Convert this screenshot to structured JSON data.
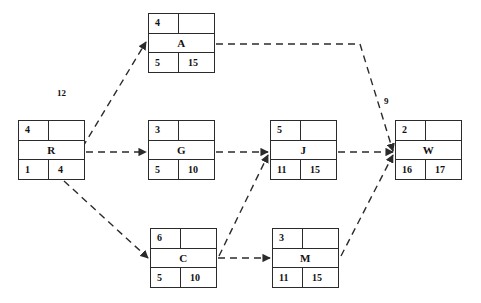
{
  "diagram": {
    "type": "activity-on-node-network",
    "background_color": "#ffffff",
    "line_color": "#2b2b2b",
    "edge_style": "dashed-arrow"
  },
  "nodes": [
    {
      "id": "R",
      "name": "R",
      "top_left": "4",
      "top_right": "",
      "bottom_left": "1",
      "bottom_right": "4",
      "x": 18,
      "y": 120
    },
    {
      "id": "A",
      "name": "A",
      "top_left": "4",
      "top_right": "",
      "bottom_left": "5",
      "bottom_right": "15",
      "x": 148,
      "y": 13
    },
    {
      "id": "G",
      "name": "G",
      "top_left": "3",
      "top_right": "",
      "bottom_left": "5",
      "bottom_right": "10",
      "x": 148,
      "y": 120
    },
    {
      "id": "C",
      "name": "C",
      "top_left": "6",
      "top_right": "",
      "bottom_left": "5",
      "bottom_right": "10",
      "x": 150,
      "y": 228
    },
    {
      "id": "J",
      "name": "J",
      "top_left": "5",
      "top_right": "",
      "bottom_left": "11",
      "bottom_right": "15",
      "x": 270,
      "y": 120
    },
    {
      "id": "M",
      "name": "M",
      "top_left": "3",
      "top_right": "",
      "bottom_left": "11",
      "bottom_right": "15",
      "x": 272,
      "y": 228
    },
    {
      "id": "W",
      "name": "W",
      "top_left": "2",
      "top_right": "",
      "bottom_left": "16",
      "bottom_right": "17",
      "x": 395,
      "y": 120
    }
  ],
  "edges": [
    {
      "from": "R",
      "to": "A",
      "label": "12"
    },
    {
      "from": "R",
      "to": "G",
      "label": ""
    },
    {
      "from": "R",
      "to": "C",
      "label": ""
    },
    {
      "from": "G",
      "to": "J",
      "label": ""
    },
    {
      "from": "C",
      "to": "J",
      "label": ""
    },
    {
      "from": "C",
      "to": "M",
      "label": ""
    },
    {
      "from": "A",
      "to": "W",
      "label": "9"
    },
    {
      "from": "J",
      "to": "W",
      "label": ""
    },
    {
      "from": "M",
      "to": "W",
      "label": ""
    }
  ],
  "edge_labels": [
    {
      "id": "label-12",
      "text": "12",
      "x": 57,
      "y": 88
    },
    {
      "id": "label-9",
      "text": "9",
      "x": 384,
      "y": 96
    }
  ]
}
